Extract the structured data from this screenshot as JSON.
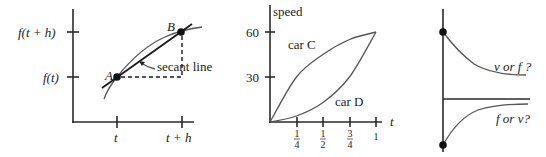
{
  "panels": {
    "secant": {
      "y_tick_upper": "f(t + h)",
      "y_tick_lower": "f(t)",
      "x_tick_left": "t",
      "x_tick_right": "t + h",
      "point_a": "A",
      "point_b": "B",
      "annotation": "secant line"
    },
    "speed": {
      "ylabel": "speed",
      "xlabel": "t",
      "y_ticks": [
        "60",
        "30"
      ],
      "x_ticks": [
        {
          "num": "1",
          "den": "4"
        },
        {
          "num": "1",
          "den": "2"
        },
        {
          "num": "3",
          "den": "4"
        },
        {
          "num": "1",
          "den": ""
        }
      ],
      "curve_c_label": "car C",
      "curve_d_label": "car D"
    },
    "decay": {
      "upper_label": "v or f ?",
      "lower_label": "f or v?"
    }
  },
  "chart_data": [
    {
      "type": "line",
      "title": "",
      "xlabel": "",
      "ylabel": "",
      "x_tick_labels": [
        "t",
        "t + h"
      ],
      "y_tick_labels": [
        "f(t)",
        "f(t + h)"
      ],
      "series": [
        {
          "name": "f (concave curve)",
          "points": "passes through A=(t, f(t)) and B=(t+h, f(t+h))"
        },
        {
          "name": "secant line",
          "points": "straight line through A and B"
        }
      ],
      "annotations": [
        "A",
        "B",
        "secant line"
      ]
    },
    {
      "type": "line",
      "title": "",
      "xlabel": "t",
      "ylabel": "speed",
      "xlim": [
        0,
        1
      ],
      "ylim": [
        0,
        60
      ],
      "x_tick_labels": [
        "1/4",
        "1/2",
        "3/4",
        "1"
      ],
      "y_tick_labels": [
        "30",
        "60"
      ],
      "series": [
        {
          "name": "car C",
          "x": [
            0,
            0.25,
            0.5,
            0.75,
            1
          ],
          "y": [
            0,
            30,
            45,
            55,
            60
          ]
        },
        {
          "name": "car D",
          "x": [
            0,
            0.25,
            0.5,
            0.75,
            1
          ],
          "y": [
            0,
            4,
            13,
            30,
            60
          ]
        }
      ]
    },
    {
      "type": "line",
      "title": "",
      "series": [
        {
          "name": "v or f ? (decreasing to asymptote)",
          "shape": "decaying from upper dot toward positive level"
        },
        {
          "name": "f or v? (increasing to asymptote)",
          "shape": "rising from lower dot toward zero level"
        }
      ]
    }
  ]
}
